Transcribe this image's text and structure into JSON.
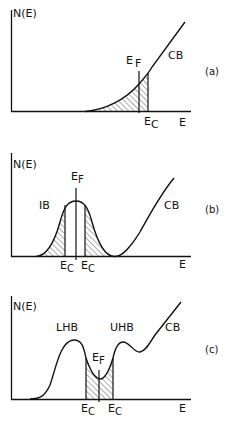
{
  "figure": {
    "panels": [
      {
        "id": "a",
        "panel_label": "(a)",
        "y_label": "N(E)",
        "x_label": "E",
        "band_label": "CB",
        "fermi_label": "E",
        "fermi_sub": "F",
        "mobility_edge_label": "E",
        "mobility_edge_sub": "C",
        "description": "Conduction band tail; Fermi level below mobility edge in localized tail states (hatched)"
      },
      {
        "id": "b",
        "panel_label": "(b)",
        "y_label": "N(E)",
        "x_label": "E",
        "band_labels": [
          "IB",
          "CB"
        ],
        "fermi_label": "E",
        "fermi_sub": "F",
        "mobility_edge_label": "E",
        "mobility_edge_sub": "C",
        "description": "Impurity band with localized tails (hatched) on both sides; Fermi level at band center between mobility edges"
      },
      {
        "id": "c",
        "panel_label": "(c)",
        "y_label": "N(E)",
        "x_label": "E",
        "band_labels": [
          "LHB",
          "UHB",
          "CB"
        ],
        "fermi_label": "E",
        "fermi_sub": "F",
        "mobility_edge_label": "E",
        "mobility_edge_sub": "C",
        "description": "Lower and upper Hubbard bands; Fermi level in pseudogap minimum with localized states between mobility edges (hatched)"
      }
    ]
  }
}
